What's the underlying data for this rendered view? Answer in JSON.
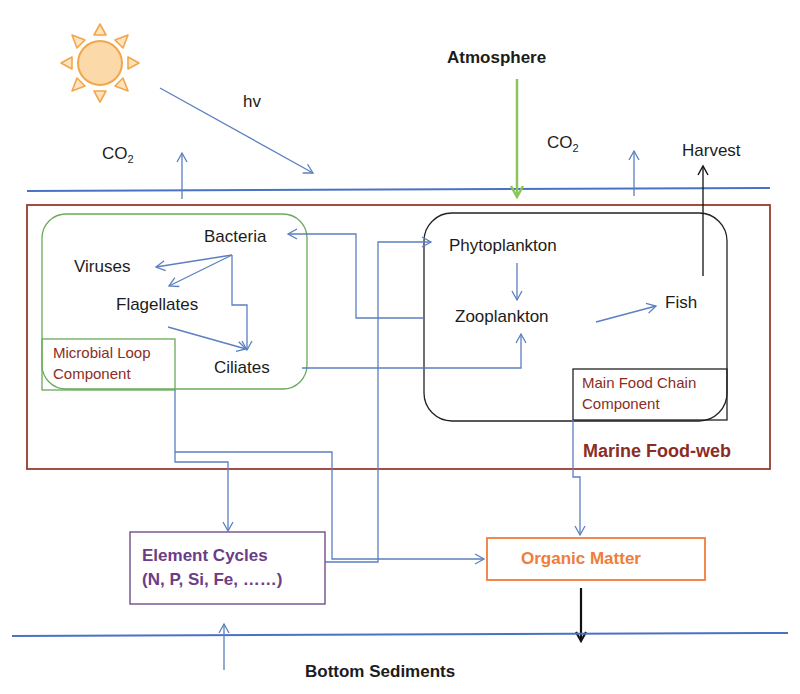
{
  "labels": {
    "atmosphere": "Atmosphere",
    "hv": "hv",
    "co2_left_main": "CO",
    "co2_left_sub": "2",
    "co2_right_main": "CO",
    "co2_right_sub": "2",
    "harvest": "Harvest",
    "bottom_sediments": "Bottom Sediments"
  },
  "marine_food_web": {
    "title": "Marine Food-web",
    "microbial_loop": {
      "label_line1": "Microbial Loop",
      "label_line2": "Component",
      "nodes": {
        "bacteria": "Bacteria",
        "viruses": "Viruses",
        "flagellates": "Flagellates",
        "ciliates": "Ciliates"
      }
    },
    "main_food_chain": {
      "label_line1": "Main Food Chain",
      "label_line2": "Component",
      "nodes": {
        "phytoplankton": "Phytoplankton",
        "zooplankton": "Zooplankton",
        "fish": "Fish"
      }
    }
  },
  "element_cycles": {
    "title": "Element Cycles",
    "subtitle": "(N, P, Si, Fe, ……)"
  },
  "organic_matter": {
    "title": "Organic Matter"
  },
  "colors": {
    "arrow_blue": "#5b7fc0",
    "surface_line": "#4a72c4",
    "food_web_border": "#9b3a2e",
    "microbial_border": "#6aaa5a",
    "main_chain_border": "#222222",
    "element_border": "#7a5a92",
    "organic_border": "#ef7d3b",
    "atmosphere_arrow": "#8cc45a",
    "sun": "#f6b65c"
  }
}
